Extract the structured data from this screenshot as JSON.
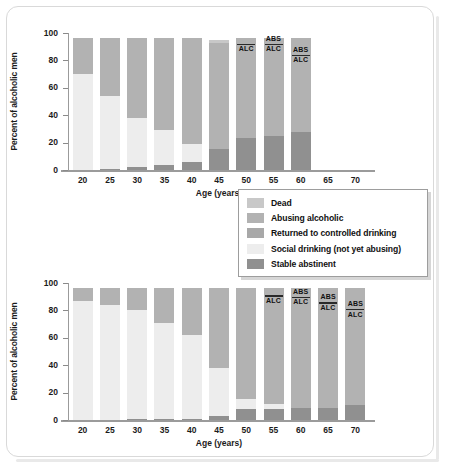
{
  "figure": {
    "ylabel": "Percent of alcoholic men",
    "xlabel": "Age (years)",
    "ytick_labels": [
      "0",
      "20",
      "40",
      "60",
      "80",
      "100"
    ]
  },
  "legend": {
    "items": [
      {
        "label": "Dead",
        "color": "#c8c8c8"
      },
      {
        "label": "Abusing alcoholic",
        "color": "#b2b2b2"
      },
      {
        "label": "Returned to controlled drinking",
        "color": "#a8a8a8"
      },
      {
        "label": "Social drinking (not yet abusing)",
        "color": "#ededed"
      },
      {
        "label": "Stable abstinent",
        "color": "#909090"
      }
    ]
  },
  "colors": {
    "dead": "#c8c8c8",
    "abusing": "#b2b2b2",
    "controlled": "#a8a8a8",
    "social": "#ededed",
    "abstinent": "#909090",
    "axis": "#9b9b9b",
    "text": "#1b1b1b",
    "frame": "#d9d9d9"
  },
  "chart_data": [
    {
      "type": "bar",
      "id": "top-chart",
      "subtype": "stacked-bar",
      "title": "",
      "xlabel": "Age (years)",
      "ylabel": "Percent of alcoholic men",
      "ylim": [
        0,
        100
      ],
      "yticks": [
        0,
        20,
        40,
        60,
        80,
        100
      ],
      "grid": false,
      "categories": [
        "20",
        "25",
        "30",
        "35",
        "40",
        "45",
        "50",
        "55",
        "60",
        "65",
        "70"
      ],
      "series": [
        {
          "name": "Stable abstinent",
          "key": "abstinent",
          "color": "#909090",
          "values": [
            0,
            1,
            2,
            4,
            6,
            15,
            23,
            25,
            28,
            null,
            null
          ]
        },
        {
          "name": "Returned to controlled drinking",
          "key": "controlled",
          "color": "#a8a8a8",
          "values": [
            0,
            0,
            0,
            0,
            0,
            0,
            0,
            0,
            0,
            null,
            null
          ]
        },
        {
          "name": "Social drinking (not yet abusing)",
          "key": "social",
          "color": "#ededed",
          "values": [
            70,
            53,
            36,
            25,
            13,
            0,
            0,
            0,
            0,
            null,
            null
          ]
        },
        {
          "name": "Abusing alcoholic",
          "key": "abusing",
          "color": "#b2b2b2",
          "values": [
            26,
            42,
            58,
            67,
            76,
            78,
            73,
            71,
            68,
            null,
            null
          ]
        },
        {
          "name": "Dead",
          "key": "dead",
          "color": "#c8c8c8",
          "values": [
            0,
            0,
            0,
            0,
            0,
            2,
            0,
            0,
            0,
            null,
            null
          ]
        }
      ],
      "bar_tops": [
        96,
        96,
        96,
        96,
        96,
        95,
        96,
        96,
        96,
        null,
        null
      ],
      "annotations": [
        {
          "category": "50",
          "labels": [
            "ALC"
          ],
          "rule_at": 92
        },
        {
          "category": "55",
          "labels": [
            "ABS",
            "ALC"
          ],
          "rule_at": 92
        },
        {
          "category": "60",
          "labels": [
            "ABS",
            "ALC"
          ],
          "rule_at": 84
        }
      ]
    },
    {
      "type": "bar",
      "id": "bottom-chart",
      "subtype": "stacked-bar",
      "title": "",
      "xlabel": "Age (years)",
      "ylabel": "Percent of alcoholic men",
      "ylim": [
        0,
        100
      ],
      "yticks": [
        0,
        20,
        40,
        60,
        80,
        100
      ],
      "grid": false,
      "categories": [
        "20",
        "25",
        "30",
        "35",
        "40",
        "45",
        "50",
        "55",
        "60",
        "65",
        "70"
      ],
      "series": [
        {
          "name": "Stable abstinent",
          "key": "abstinent",
          "color": "#909090",
          "values": [
            0,
            0,
            1,
            1,
            1,
            3,
            8,
            8,
            9,
            9,
            11
          ]
        },
        {
          "name": "Returned to controlled drinking",
          "key": "controlled",
          "color": "#a8a8a8",
          "values": [
            0,
            0,
            0,
            0,
            0,
            0,
            0,
            0,
            0,
            0,
            0
          ]
        },
        {
          "name": "Social drinking (not yet abusing)",
          "key": "social",
          "color": "#ededed",
          "values": [
            87,
            84,
            79,
            70,
            61,
            35,
            7,
            4,
            0,
            0,
            0
          ]
        },
        {
          "name": "Abusing alcoholic",
          "key": "abusing",
          "color": "#b2b2b2",
          "values": [
            9,
            12,
            16,
            25,
            34,
            58,
            81,
            84,
            87,
            87,
            85
          ]
        },
        {
          "name": "Dead",
          "key": "dead",
          "color": "#c8c8c8",
          "values": [
            0,
            0,
            0,
            0,
            0,
            0,
            0,
            0,
            0,
            0,
            0
          ]
        }
      ],
      "bar_tops": [
        96,
        96,
        96,
        96,
        96,
        96,
        96,
        96,
        96,
        96,
        96
      ],
      "annotations": [
        {
          "category": "55",
          "labels": [
            "ALC"
          ],
          "rule_at": 91
        },
        {
          "category": "60",
          "labels": [
            "ABS",
            "ALC"
          ],
          "rule_at": 90
        },
        {
          "category": "65",
          "labels": [
            "ABS",
            "ALC"
          ],
          "rule_at": 86
        },
        {
          "category": "70",
          "labels": [
            "ABS",
            "ALC"
          ],
          "rule_at": 81
        }
      ]
    }
  ]
}
